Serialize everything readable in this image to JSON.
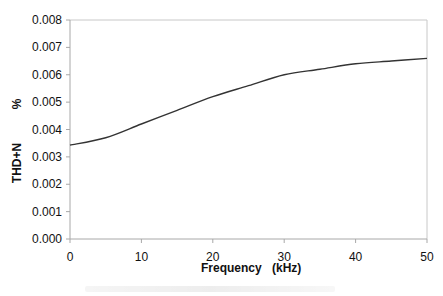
{
  "chart_data": {
    "type": "line",
    "title": "",
    "xlabel": "Frequency",
    "xlabel_unit": "(kHz)",
    "ylabel": "THD+N",
    "ylabel_unit": "%",
    "xlim": [
      0,
      50
    ],
    "ylim": [
      0,
      0.008
    ],
    "x_ticks": [
      0,
      10,
      20,
      30,
      40,
      50
    ],
    "x_tick_labels": [
      "0",
      "10",
      "20",
      "30",
      "40",
      "50"
    ],
    "y_ticks": [
      0,
      0.001,
      0.002,
      0.003,
      0.004,
      0.005,
      0.006,
      0.007,
      0.008
    ],
    "y_tick_labels": [
      "0.000",
      "0.001",
      "0.002",
      "0.003",
      "0.004",
      "0.005",
      "0.006",
      "0.007",
      "0.008"
    ],
    "grid": false,
    "legend": null,
    "series": [
      {
        "name": "THD+N",
        "color": "#333333",
        "x": [
          0,
          5,
          10,
          15,
          20,
          25,
          30,
          35,
          40,
          45,
          50
        ],
        "values": [
          0.00343,
          0.0037,
          0.0042,
          0.0047,
          0.0052,
          0.0056,
          0.006,
          0.0062,
          0.0064,
          0.0065,
          0.0066
        ]
      }
    ]
  },
  "plot": {
    "left": 70,
    "top": 20,
    "right": 427,
    "bottom": 239,
    "axis_color": "#a8a8a8",
    "frame_color": "#c8c8c8"
  }
}
